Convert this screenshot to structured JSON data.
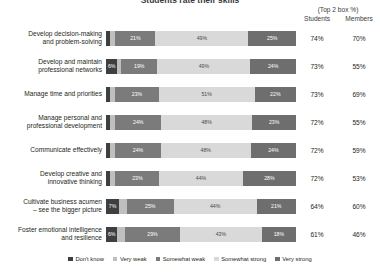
{
  "title": "Students rate their skills",
  "header": {
    "top2box_note": "(Top 2 box %)",
    "col_students": "Students",
    "col_members": "Members"
  },
  "legend": {
    "position": "bottom-center",
    "items": [
      {
        "label": "Don't know",
        "color": "#3f3f3f"
      },
      {
        "label": "Very weak",
        "color": "#bfbfbf"
      },
      {
        "label": "Somewhat weak",
        "color": "#7b7b7b"
      },
      {
        "label": "Somewhat strong",
        "color": "#d9d9d9"
      },
      {
        "label": "Very strong",
        "color": "#6e6e6e"
      }
    ]
  },
  "chart_data": {
    "type": "bar",
    "subtype": "100% stacked horizontal bar",
    "title": "Students rate their skills",
    "xlabel": "",
    "ylabel": "",
    "xlim": [
      0,
      100
    ],
    "grid": false,
    "legend_position": "bottom-center",
    "series": [
      {
        "name": "Don't know",
        "color": "#3f3f3f",
        "values": [
          2,
          6,
          2,
          2,
          2,
          2,
          7,
          6
        ]
      },
      {
        "name": "Very weak",
        "color": "#bfbfbf",
        "values": [
          3,
          2,
          3,
          3,
          3,
          3,
          4,
          4
        ]
      },
      {
        "name": "Somewhat weak",
        "color": "#7b7b7b",
        "values": [
          21,
          19,
          23,
          24,
          24,
          23,
          25,
          29
        ]
      },
      {
        "name": "Somewhat strong",
        "color": "#d9d9d9",
        "values": [
          49,
          49,
          51,
          48,
          48,
          44,
          44,
          43
        ]
      },
      {
        "name": "Very strong",
        "color": "#6e6e6e",
        "values": [
          25,
          24,
          22,
          23,
          24,
          28,
          21,
          18
        ]
      }
    ],
    "categories": [
      "Develop decision-making and problem-solving",
      "Develop and maintain professional networks",
      "Manage time and priorities",
      "Manage personal and professional development",
      "Communicate effectively",
      "Develop creative and innovative thinking",
      "Cultivate business acumen – see the bigger picture",
      "Foster emotional intelligence and resilience"
    ],
    "annotations": {
      "students_top2box": [
        "74%",
        "73%",
        "73%",
        "72%",
        "72%",
        "72%",
        "64%",
        "61%"
      ],
      "members_top2box": [
        "70%",
        "55%",
        "69%",
        "55%",
        "59%",
        "53%",
        "60%",
        "46%"
      ]
    }
  },
  "rows": [
    {
      "label_line1": "Develop decision-making",
      "label_line2": "and problem-solving",
      "students": "74%",
      "members": "70%",
      "segments": [
        {
          "name": "Don't know",
          "value": 2,
          "label": "",
          "color": "#3f3f3f",
          "show": false
        },
        {
          "name": "Very weak",
          "value": 3,
          "label": "",
          "color": "#bfbfbf",
          "show": false
        },
        {
          "name": "Somewhat weak",
          "value": 21,
          "label": "21%",
          "color": "#7b7b7b",
          "show": true
        },
        {
          "name": "Somewhat strong",
          "value": 49,
          "label": "49%",
          "color": "#d9d9d9",
          "show": true
        },
        {
          "name": "Very strong",
          "value": 25,
          "label": "25%",
          "color": "#6e6e6e",
          "show": true
        }
      ]
    },
    {
      "label_line1": "Develop and maintain",
      "label_line2": "professional networks",
      "students": "73%",
      "members": "55%",
      "segments": [
        {
          "name": "Don't know",
          "value": 6,
          "label": "6%",
          "color": "#3f3f3f",
          "show": true
        },
        {
          "name": "Very weak",
          "value": 2,
          "label": "",
          "color": "#bfbfbf",
          "show": false
        },
        {
          "name": "Somewhat weak",
          "value": 19,
          "label": "19%",
          "color": "#7b7b7b",
          "show": true
        },
        {
          "name": "Somewhat strong",
          "value": 49,
          "label": "49%",
          "color": "#d9d9d9",
          "show": true
        },
        {
          "name": "Very strong",
          "value": 24,
          "label": "24%",
          "color": "#6e6e6e",
          "show": true
        }
      ]
    },
    {
      "label_line1": "Manage time and priorities",
      "label_line2": "",
      "students": "73%",
      "members": "69%",
      "segments": [
        {
          "name": "Don't know",
          "value": 2,
          "label": "",
          "color": "#3f3f3f",
          "show": false
        },
        {
          "name": "Very weak",
          "value": 3,
          "label": "",
          "color": "#bfbfbf",
          "show": false
        },
        {
          "name": "Somewhat weak",
          "value": 23,
          "label": "23%",
          "color": "#7b7b7b",
          "show": true
        },
        {
          "name": "Somewhat strong",
          "value": 51,
          "label": "51%",
          "color": "#d9d9d9",
          "show": true
        },
        {
          "name": "Very strong",
          "value": 22,
          "label": "22%",
          "color": "#6e6e6e",
          "show": true
        }
      ]
    },
    {
      "label_line1": "Manage personal and",
      "label_line2": "professional development",
      "students": "72%",
      "members": "55%",
      "segments": [
        {
          "name": "Don't know",
          "value": 2,
          "label": "",
          "color": "#3f3f3f",
          "show": false
        },
        {
          "name": "Very weak",
          "value": 3,
          "label": "",
          "color": "#bfbfbf",
          "show": false
        },
        {
          "name": "Somewhat weak",
          "value": 24,
          "label": "24%",
          "color": "#7b7b7b",
          "show": true
        },
        {
          "name": "Somewhat strong",
          "value": 48,
          "label": "48%",
          "color": "#d9d9d9",
          "show": true
        },
        {
          "name": "Very strong",
          "value": 23,
          "label": "23%",
          "color": "#6e6e6e",
          "show": true
        }
      ]
    },
    {
      "label_line1": "Communicate effectively",
      "label_line2": "",
      "students": "72%",
      "members": "59%",
      "segments": [
        {
          "name": "Don't know",
          "value": 2,
          "label": "",
          "color": "#3f3f3f",
          "show": false
        },
        {
          "name": "Very weak",
          "value": 3,
          "label": "",
          "color": "#bfbfbf",
          "show": false
        },
        {
          "name": "Somewhat weak",
          "value": 24,
          "label": "24%",
          "color": "#7b7b7b",
          "show": true
        },
        {
          "name": "Somewhat strong",
          "value": 48,
          "label": "48%",
          "color": "#d9d9d9",
          "show": true
        },
        {
          "name": "Very strong",
          "value": 24,
          "label": "24%",
          "color": "#6e6e6e",
          "show": true
        }
      ]
    },
    {
      "label_line1": "Develop creative and",
      "label_line2": "innovative thinking",
      "students": "72%",
      "members": "53%",
      "segments": [
        {
          "name": "Don't know",
          "value": 2,
          "label": "",
          "color": "#3f3f3f",
          "show": false
        },
        {
          "name": "Very weak",
          "value": 3,
          "label": "",
          "color": "#bfbfbf",
          "show": false
        },
        {
          "name": "Somewhat weak",
          "value": 23,
          "label": "23%",
          "color": "#7b7b7b",
          "show": true
        },
        {
          "name": "Somewhat strong",
          "value": 44,
          "label": "44%",
          "color": "#d9d9d9",
          "show": true
        },
        {
          "name": "Very strong",
          "value": 28,
          "label": "28%",
          "color": "#6e6e6e",
          "show": true
        }
      ]
    },
    {
      "label_line1": "Cultivate business acumen",
      "label_line2": "– see the bigger picture",
      "students": "64%",
      "members": "60%",
      "segments": [
        {
          "name": "Don't know",
          "value": 7,
          "label": "7%",
          "color": "#3f3f3f",
          "show": true
        },
        {
          "name": "Very weak",
          "value": 4,
          "label": "",
          "color": "#bfbfbf",
          "show": false
        },
        {
          "name": "Somewhat weak",
          "value": 25,
          "label": "25%",
          "color": "#7b7b7b",
          "show": true
        },
        {
          "name": "Somewhat strong",
          "value": 44,
          "label": "44%",
          "color": "#d9d9d9",
          "show": true
        },
        {
          "name": "Very strong",
          "value": 21,
          "label": "21%",
          "color": "#6e6e6e",
          "show": true
        }
      ]
    },
    {
      "label_line1": "Foster emotional intelligence",
      "label_line2": "and resilience",
      "students": "61%",
      "members": "46%",
      "segments": [
        {
          "name": "Don't know",
          "value": 6,
          "label": "6%",
          "color": "#3f3f3f",
          "show": true
        },
        {
          "name": "Very weak",
          "value": 4,
          "label": "",
          "color": "#bfbfbf",
          "show": false
        },
        {
          "name": "Somewhat weak",
          "value": 29,
          "label": "29%",
          "color": "#7b7b7b",
          "show": true
        },
        {
          "name": "Somewhat strong",
          "value": 43,
          "label": "43%",
          "color": "#d9d9d9",
          "show": true
        },
        {
          "name": "Very strong",
          "value": 18,
          "label": "18%",
          "color": "#6e6e6e",
          "show": true
        }
      ]
    }
  ]
}
